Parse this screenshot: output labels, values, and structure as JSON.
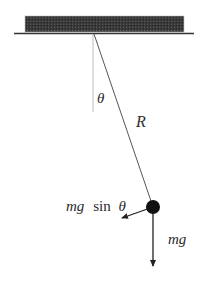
{
  "diagram": {
    "type": "simple-pendulum-force-diagram",
    "labels": {
      "angle": "θ",
      "length": "R",
      "tangential_force_italic": "mg",
      "tangential_force_func": "sin",
      "tangential_force_angle": "θ",
      "weight": "mg"
    },
    "colors": {
      "ceiling_fill": "#3a3a3a",
      "line": "#333333",
      "reference_line": "#bdbdbd",
      "bob": "#111111",
      "text": "#2a2a2a"
    },
    "geometry": {
      "ceiling": {
        "x": 25,
        "y": 16,
        "width": 159,
        "height": 16
      },
      "ceiling_line": {
        "x1": 14,
        "x2": 194,
        "y": 33
      },
      "pivot": {
        "x": 94,
        "y": 34
      },
      "reference_line_end_y": 112,
      "bob": {
        "x": 153,
        "y": 207,
        "r": 7
      },
      "weight_arrow_tip": {
        "x": 153,
        "y": 268
      },
      "tangential_arrow_tip": {
        "x": 120,
        "y": 219
      }
    }
  }
}
